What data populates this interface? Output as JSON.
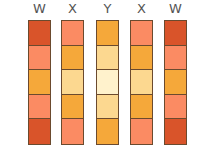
{
  "colors": {
    "dark": "#d9542a",
    "salmon": "#fb8b63",
    "orange": "#f5a83a",
    "light": "#fcd890",
    "pale": "#fff2cc"
  },
  "columns": [
    {
      "label": "W",
      "cells": [
        "dark",
        "salmon",
        "orange",
        "salmon",
        "dark"
      ]
    },
    {
      "label": "X",
      "cells": [
        "salmon",
        "orange",
        "light",
        "orange",
        "salmon"
      ]
    },
    {
      "label": "Y",
      "cells": [
        "orange",
        "light",
        "pale",
        "light",
        "orange"
      ]
    },
    {
      "label": "X",
      "cells": [
        "salmon",
        "orange",
        "light",
        "orange",
        "salmon"
      ]
    },
    {
      "label": "W",
      "cells": [
        "dark",
        "salmon",
        "orange",
        "salmon",
        "dark"
      ]
    }
  ]
}
